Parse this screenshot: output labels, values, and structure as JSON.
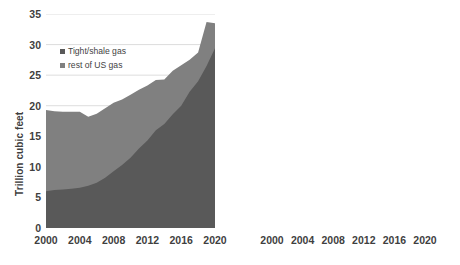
{
  "chart_data": [
    {
      "type": "area",
      "id": "gas",
      "title": "",
      "xlabel": "",
      "ylabel": "Trillion cubic feet",
      "xlim": [
        2000,
        2020
      ],
      "ylim": [
        0,
        35
      ],
      "ytick_step": 5,
      "yticks": [
        0,
        5,
        10,
        15,
        20,
        25,
        30,
        35
      ],
      "xticks": [
        2000,
        2004,
        2008,
        2012,
        2016,
        2020
      ],
      "grid": true,
      "stacked": true,
      "legend_position": "inside-top-left",
      "colors": {
        "tight_shale": "#595959",
        "rest_of_us": "#808080",
        "gridline": "#d9d9d9",
        "text": "#3f3f3f"
      },
      "x": [
        2000,
        2001,
        2002,
        2003,
        2004,
        2005,
        2006,
        2007,
        2008,
        2009,
        2010,
        2011,
        2012,
        2013,
        2014,
        2015,
        2016,
        2017,
        2018,
        2019,
        2020
      ],
      "series": [
        {
          "name": "Tight/shale gas",
          "values": [
            6.0,
            6.2,
            6.3,
            6.4,
            6.6,
            6.9,
            7.4,
            8.2,
            9.3,
            10.3,
            11.5,
            13.0,
            14.3,
            16.0,
            17.0,
            18.6,
            20.0,
            22.3,
            24.0,
            26.5,
            29.4
          ]
        },
        {
          "name": "rest of US gas",
          "values": [
            13.3,
            12.9,
            12.7,
            12.6,
            12.4,
            11.3,
            11.3,
            11.4,
            11.2,
            10.7,
            10.3,
            9.6,
            9.0,
            8.2,
            7.3,
            7.1,
            6.6,
            5.2,
            4.7,
            7.2,
            4.1
          ]
        }
      ],
      "totals": [
        19.3,
        19.1,
        19.0,
        19.0,
        19.0,
        18.2,
        18.7,
        19.6,
        20.5,
        21.0,
        21.8,
        22.6,
        23.3,
        24.2,
        24.3,
        25.7,
        26.6,
        27.5,
        28.7,
        33.7,
        33.5
      ]
    },
    {
      "type": "area",
      "id": "oil",
      "title": "",
      "xlabel": "",
      "ylabel": "Million barrels per day",
      "xlim": [
        2000,
        2020
      ],
      "ylim": [
        0,
        14
      ],
      "ytick_step": 2,
      "yticks": [
        0,
        2,
        4,
        6,
        8,
        10,
        12,
        14
      ],
      "xticks": [
        2000,
        2004,
        2008,
        2012,
        2016,
        2020
      ],
      "grid": true,
      "stacked": true,
      "legend_position": "inside-top-left",
      "colors": {
        "tight_shale": "#595959",
        "rest_of_us": "#808080",
        "gridline": "#d9d9d9",
        "text": "#3f3f3f"
      },
      "x": [
        2000,
        2001,
        2002,
        2003,
        2004,
        2005,
        2006,
        2007,
        2008,
        2009,
        2010,
        2011,
        2012,
        2013,
        2014,
        2015,
        2016,
        2017,
        2018,
        2019,
        2020
      ],
      "series": [
        {
          "name": "Tight/shale oil",
          "values": [
            0.72,
            0.73,
            0.74,
            0.75,
            0.76,
            0.78,
            0.82,
            0.88,
            0.95,
            1.1,
            1.3,
            1.8,
            2.6,
            3.5,
            4.6,
            5.1,
            4.4,
            5.2,
            6.5,
            7.4,
            7.9
          ]
        },
        {
          "name": "rest of US oil",
          "values": [
            5.08,
            4.97,
            4.86,
            4.6,
            4.39,
            4.32,
            4.23,
            4.17,
            4.05,
            4.15,
            4.25,
            4.0,
            3.85,
            3.9,
            4.7,
            4.2,
            4.3,
            4.3,
            4.1,
            4.8,
            3.5
          ]
        }
      ],
      "totals": [
        5.8,
        5.7,
        5.6,
        5.35,
        5.15,
        5.1,
        5.05,
        5.05,
        5.0,
        5.25,
        5.55,
        5.8,
        6.45,
        7.4,
        9.3,
        9.3,
        8.7,
        9.5,
        10.6,
        12.2,
        11.4
      ]
    }
  ],
  "gas_panel": {
    "axis_title": "Trillion cubic feet",
    "yticks": [
      "0",
      "5",
      "10",
      "15",
      "20",
      "25",
      "30",
      "35"
    ],
    "xticks": [
      "2000",
      "2004",
      "2008",
      "2012",
      "2016",
      "2020"
    ],
    "legend": [
      {
        "label": "Tight/shale gas",
        "color": "#595959"
      },
      {
        "label": "rest of US gas",
        "color": "#808080"
      }
    ]
  },
  "oil_panel": {
    "axis_title": "Million barrels per day",
    "yticks": [
      "0",
      "2",
      "4",
      "6",
      "8",
      "10",
      "12",
      "14"
    ],
    "xticks": [
      "2000",
      "2004",
      "2008",
      "2012",
      "2016",
      "2020"
    ],
    "legend": [
      {
        "label": "Tight/shale oil",
        "color": "#595959"
      },
      {
        "label": "rest of US oil",
        "color": "#808080"
      }
    ]
  }
}
